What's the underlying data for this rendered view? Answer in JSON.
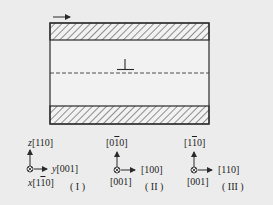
{
  "figure": {
    "arrow_direction": "right",
    "dislocation_symbol": "⊥",
    "colors": {
      "background": "#ececec",
      "line": "#2a2a2a",
      "hatch": "#3a3a3a"
    }
  },
  "coordinate_systems": [
    {
      "id": "I",
      "roman": "( I )",
      "up": {
        "axis": "z",
        "dir": "[110]"
      },
      "right": {
        "axis": "y",
        "dir": "[001]"
      },
      "out": {
        "axis": "x",
        "dir_pre": "[1",
        "dir_bar": "1",
        "dir_post": "0]"
      }
    },
    {
      "id": "II",
      "roman": "( II )",
      "up": {
        "dir_pre": "[0",
        "dir_bar": "1",
        "dir_post": "0]"
      },
      "right": {
        "dir": "[100]"
      },
      "out": {
        "dir": "[001]"
      }
    },
    {
      "id": "III",
      "roman": "( III )",
      "up": {
        "dir_pre": "[1",
        "dir_bar": "1",
        "dir_post": "0]"
      },
      "right": {
        "dir": "[110]"
      },
      "out": {
        "dir": "[001]"
      }
    }
  ]
}
